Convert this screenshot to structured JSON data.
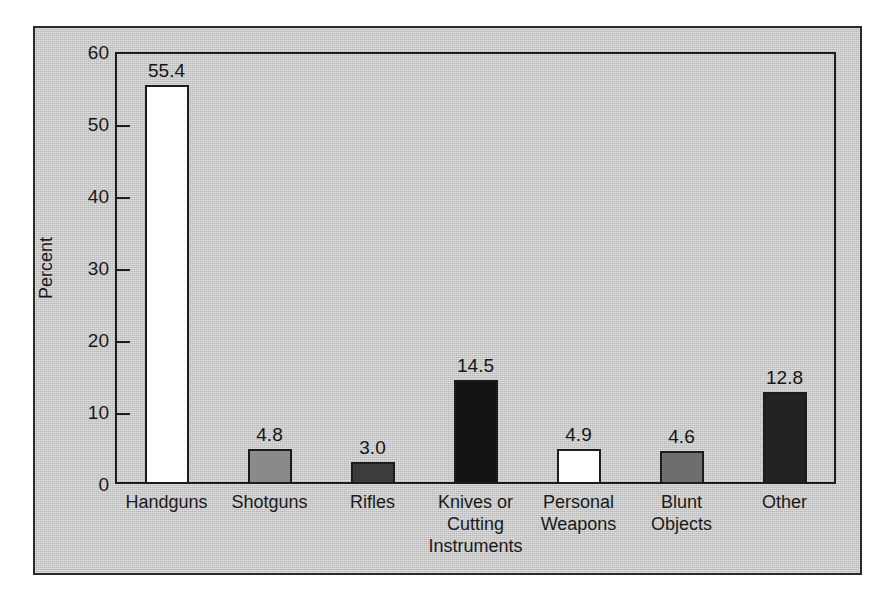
{
  "chart_data": {
    "type": "bar",
    "title": "",
    "subtitle": "",
    "xlabel": "",
    "ylabel": "Percent",
    "ylim": [
      0,
      60
    ],
    "ytick_step": 10,
    "yticks": [
      "0",
      "10",
      "20",
      "30",
      "40",
      "50",
      "60"
    ],
    "grid": false,
    "legend": "none",
    "categories": [
      "Handguns",
      "Shotguns",
      "Rifles",
      "Knives or\nCutting\nInstruments",
      "Personal\nWeapons",
      "Blunt\nObjects",
      "Other"
    ],
    "values": [
      55.4,
      4.8,
      3.0,
      14.5,
      4.9,
      4.6,
      12.8
    ],
    "value_labels": [
      "55.4",
      "4.8",
      "3.0",
      "14.5",
      "4.9",
      "4.6",
      "12.8"
    ],
    "bar_fills": [
      "#ffffff",
      "#8a8a8a",
      "#3c3c3c",
      "#141414",
      "#ffffff",
      "#6e6e6e",
      "#232323"
    ],
    "bar_edge_color": "#1c1c1c"
  },
  "figure": {
    "panel_background": "#c9c9c9",
    "panel_border_color": "#2a2a2a",
    "page_background": "#ffffff",
    "axis_color": "#1c1c1c",
    "text_color": "#1a1a1a"
  }
}
